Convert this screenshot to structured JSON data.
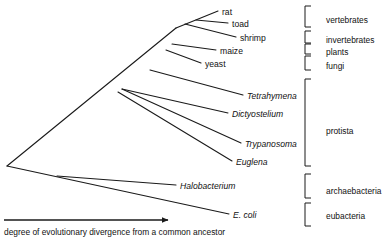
{
  "figure": {
    "type": "phylogenetic-tree",
    "axis_caption": "degree of evolutionary divergence from a common ancestor",
    "line_color": "#1a1a1a",
    "background": "#ffffff"
  },
  "taxa": [
    {
      "name": "rat",
      "style": "roman",
      "label_x": 222,
      "label_y": 8,
      "tip_x": 218,
      "tip_y": 11
    },
    {
      "name": "toad",
      "style": "roman",
      "label_x": 232,
      "label_y": 20,
      "tip_x": 228,
      "tip_y": 23
    },
    {
      "name": "shrimp",
      "style": "roman",
      "label_x": 240,
      "label_y": 34,
      "tip_x": 236,
      "tip_y": 37
    },
    {
      "name": "maize",
      "style": "roman",
      "label_x": 220,
      "label_y": 47,
      "tip_x": 216,
      "tip_y": 50
    },
    {
      "name": "yeast",
      "style": "roman",
      "label_x": 205,
      "label_y": 60,
      "tip_x": 201,
      "tip_y": 63
    },
    {
      "name": "Tetrahymena",
      "style": "italic",
      "label_x": 247,
      "label_y": 92,
      "tip_x": 243,
      "tip_y": 95
    },
    {
      "name": "Dictyostelium",
      "style": "italic",
      "label_x": 232,
      "label_y": 110,
      "tip_x": 228,
      "tip_y": 113
    },
    {
      "name": "Trypanosoma",
      "style": "italic",
      "label_x": 245,
      "label_y": 140,
      "tip_x": 241,
      "tip_y": 143
    },
    {
      "name": "Euglena",
      "style": "italic",
      "label_x": 236,
      "label_y": 158,
      "tip_x": 232,
      "tip_y": 161
    },
    {
      "name": "Halobacterium",
      "style": "italic",
      "label_x": 180,
      "label_y": 182,
      "tip_x": 176,
      "tip_y": 185
    },
    {
      "name": "E. coli",
      "style": "italic",
      "label_x": 233,
      "label_y": 211,
      "tip_x": 229,
      "tip_y": 214
    }
  ],
  "groups": [
    {
      "label": "vertebrates",
      "label_x": 326,
      "label_y": 16,
      "bracket_top": 6,
      "bracket_bottom": 27,
      "bracket_x": 305
    },
    {
      "label": "invertebrates",
      "label_x": 326,
      "label_y": 36,
      "bracket_top": 31,
      "bracket_bottom": 43,
      "bracket_x": 305
    },
    {
      "label": "plants",
      "label_x": 326,
      "label_y": 48,
      "bracket_top": 44,
      "bracket_bottom": 54,
      "bracket_x": 305
    },
    {
      "label": "fungi",
      "label_x": 326,
      "label_y": 62,
      "bracket_top": 56,
      "bracket_bottom": 70,
      "bracket_x": 305
    },
    {
      "label": "protista",
      "label_x": 326,
      "label_y": 127,
      "bracket_top": 79,
      "bracket_bottom": 166,
      "bracket_x": 305
    },
    {
      "label": "archaebacteria",
      "label_x": 326,
      "label_y": 187,
      "bracket_top": 174,
      "bracket_bottom": 198,
      "bracket_x": 305
    },
    {
      "label": "eubacteria",
      "label_x": 326,
      "label_y": 212,
      "bracket_top": 203,
      "bracket_bottom": 226,
      "bracket_x": 305
    }
  ],
  "branches": [
    {
      "from": "root",
      "x1": 7,
      "y1": 166,
      "x2": 176,
      "y2": 28
    },
    {
      "from": "root",
      "x1": 7,
      "y1": 166,
      "x2": 229,
      "y2": 214
    },
    {
      "from": "node-arch",
      "x1": 57,
      "y1": 176,
      "x2": 176,
      "y2": 185
    },
    {
      "from": "node-euk1",
      "x1": 176,
      "y1": 28,
      "x2": 218,
      "y2": 11
    },
    {
      "from": "node-euk1",
      "x1": 196,
      "y1": 20,
      "x2": 228,
      "y2": 23
    },
    {
      "from": "node-euk2",
      "x1": 185,
      "y1": 24,
      "x2": 236,
      "y2": 37
    },
    {
      "from": "node-plant",
      "x1": 172,
      "y1": 44,
      "x2": 216,
      "y2": 50
    },
    {
      "from": "node-fungi",
      "x1": 166,
      "y1": 50,
      "x2": 201,
      "y2": 63
    },
    {
      "from": "node-prot1",
      "x1": 150,
      "y1": 70,
      "x2": 243,
      "y2": 95
    },
    {
      "from": "node-prot2",
      "x1": 122,
      "y1": 89,
      "x2": 228,
      "y2": 113
    },
    {
      "from": "node-prot3",
      "x1": 122,
      "y1": 89,
      "x2": 241,
      "y2": 143
    },
    {
      "from": "node-prot4",
      "x1": 118,
      "y1": 92,
      "x2": 232,
      "y2": 161
    }
  ],
  "axis_arrow": {
    "x1": 4,
    "y1": 220,
    "x2": 168,
    "y2": 220
  }
}
